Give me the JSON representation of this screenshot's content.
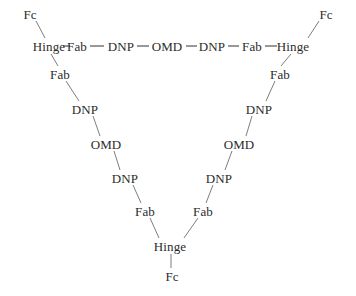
{
  "diagram": {
    "background_color": "#ffffff",
    "text_color": "#2b2b2b",
    "edge_color": "#6e6e6e",
    "dash_color": "#3a3a3a",
    "font_size_px": 13,
    "nodes": [
      {
        "id": "fc-top-left",
        "label": "Fc",
        "x": 30,
        "y": 14
      },
      {
        "id": "hinge-top-left",
        "label": "Hinge",
        "x": 49,
        "y": 46
      },
      {
        "id": "fab-top-left",
        "label": "Fab",
        "x": 77,
        "y": 46
      },
      {
        "id": "dnp-top-left",
        "label": "DNP",
        "x": 121,
        "y": 46
      },
      {
        "id": "omd-top-center",
        "label": "OMD",
        "x": 167,
        "y": 46
      },
      {
        "id": "dnp-top-right",
        "label": "DNP",
        "x": 212,
        "y": 46
      },
      {
        "id": "fab-top-right",
        "label": "Fab",
        "x": 252,
        "y": 46
      },
      {
        "id": "hinge-top-right",
        "label": "Hinge",
        "x": 293,
        "y": 46
      },
      {
        "id": "fc-top-right",
        "label": "Fc",
        "x": 326,
        "y": 14
      },
      {
        "id": "fab-left-1",
        "label": "Fab",
        "x": 60,
        "y": 74
      },
      {
        "id": "dnp-left-2",
        "label": "DNP",
        "x": 85,
        "y": 109
      },
      {
        "id": "omd-left-3",
        "label": "OMD",
        "x": 106,
        "y": 144
      },
      {
        "id": "dnp-left-4",
        "label": "DNP",
        "x": 125,
        "y": 178
      },
      {
        "id": "fab-left-5",
        "label": "Fab",
        "x": 145,
        "y": 211
      },
      {
        "id": "fab-right-1",
        "label": "Fab",
        "x": 280,
        "y": 74
      },
      {
        "id": "dnp-right-2",
        "label": "DNP",
        "x": 259,
        "y": 109
      },
      {
        "id": "omd-right-3",
        "label": "OMD",
        "x": 239,
        "y": 144
      },
      {
        "id": "dnp-right-4",
        "label": "DNP",
        "x": 219,
        "y": 178
      },
      {
        "id": "fab-right-5",
        "label": "Fab",
        "x": 203,
        "y": 211
      },
      {
        "id": "hinge-bottom",
        "label": "Hinge",
        "x": 170,
        "y": 246
      },
      {
        "id": "fc-bottom",
        "label": "Fc",
        "x": 172,
        "y": 276
      }
    ],
    "edges": [
      {
        "from": "fc-top-left",
        "to": "hinge-top-left",
        "style": "diagonal",
        "x1": 36,
        "y1": 21,
        "x2": 45,
        "y2": 38
      },
      {
        "from": "hinge-top-left",
        "to": "fab-left-1",
        "style": "diagonal",
        "x1": 51,
        "y1": 54,
        "x2": 58,
        "y2": 66
      },
      {
        "from": "hinge-top-left",
        "to": "fab-top-left",
        "style": "dash",
        "x1": 63,
        "y1": 46,
        "x2": 70,
        "y2": 46
      },
      {
        "from": "fab-top-left",
        "to": "dnp-top-left",
        "style": "dash",
        "x1": 90,
        "y1": 46,
        "x2": 104,
        "y2": 46
      },
      {
        "from": "dnp-top-left",
        "to": "omd-top-center",
        "style": "dash",
        "x1": 137,
        "y1": 46,
        "x2": 149,
        "y2": 46
      },
      {
        "from": "omd-top-center",
        "to": "dnp-top-right",
        "style": "dash",
        "x1": 186,
        "y1": 46,
        "x2": 197,
        "y2": 46
      },
      {
        "from": "dnp-top-right",
        "to": "fab-top-right",
        "style": "dash",
        "x1": 228,
        "y1": 46,
        "x2": 239,
        "y2": 46
      },
      {
        "from": "fab-top-right",
        "to": "hinge-top-right",
        "style": "dash",
        "x1": 265,
        "y1": 46,
        "x2": 277,
        "y2": 46
      },
      {
        "from": "hinge-top-right",
        "to": "fc-top-right",
        "style": "diagonal",
        "x1": 308,
        "y1": 38,
        "x2": 319,
        "y2": 21
      },
      {
        "from": "hinge-top-right",
        "to": "fab-right-1",
        "style": "diagonal",
        "x1": 291,
        "y1": 54,
        "x2": 281,
        "y2": 66
      },
      {
        "from": "fab-left-1",
        "to": "dnp-left-2",
        "style": "diagonal",
        "x1": 66,
        "y1": 81,
        "x2": 79,
        "y2": 101
      },
      {
        "from": "dnp-left-2",
        "to": "omd-left-3",
        "style": "diagonal",
        "x1": 93,
        "y1": 116,
        "x2": 100,
        "y2": 136
      },
      {
        "from": "omd-left-3",
        "to": "dnp-left-4",
        "style": "diagonal",
        "x1": 114,
        "y1": 151,
        "x2": 120,
        "y2": 170
      },
      {
        "from": "dnp-left-4",
        "to": "fab-left-5",
        "style": "diagonal",
        "x1": 133,
        "y1": 185,
        "x2": 141,
        "y2": 203
      },
      {
        "from": "fab-left-5",
        "to": "hinge-bottom",
        "style": "diagonal",
        "x1": 150,
        "y1": 218,
        "x2": 159,
        "y2": 238
      },
      {
        "from": "fab-right-1",
        "to": "dnp-right-2",
        "style": "diagonal",
        "x1": 275,
        "y1": 81,
        "x2": 266,
        "y2": 101
      },
      {
        "from": "dnp-right-2",
        "to": "omd-right-3",
        "style": "diagonal",
        "x1": 252,
        "y1": 116,
        "x2": 246,
        "y2": 136
      },
      {
        "from": "omd-right-3",
        "to": "dnp-right-4",
        "style": "diagonal",
        "x1": 232,
        "y1": 151,
        "x2": 225,
        "y2": 170
      },
      {
        "from": "dnp-right-4",
        "to": "fab-right-5",
        "style": "diagonal",
        "x1": 213,
        "y1": 185,
        "x2": 206,
        "y2": 203
      },
      {
        "from": "fab-right-5",
        "to": "hinge-bottom",
        "style": "diagonal",
        "x1": 198,
        "y1": 218,
        "x2": 184,
        "y2": 238
      },
      {
        "from": "hinge-bottom",
        "to": "fc-bottom",
        "style": "vertical",
        "x1": 171,
        "y1": 254,
        "x2": 171,
        "y2": 268
      }
    ]
  }
}
